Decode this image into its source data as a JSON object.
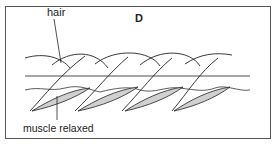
{
  "figure": {
    "panel_label": "D",
    "labels": {
      "hair": "hair",
      "muscle": "muscle relaxed"
    },
    "colors": {
      "stroke": "#222222",
      "skin_line": "#888888",
      "muscle_fill": "#d0d0d0",
      "border": "#555555"
    },
    "elements": {
      "hair_count": 5,
      "muscle_count": 4
    }
  }
}
